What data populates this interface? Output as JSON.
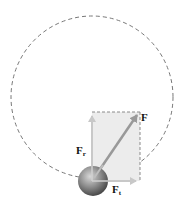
{
  "diagram": {
    "title": "",
    "path": {
      "type": "circle",
      "style": "dashed",
      "color": "#777777"
    },
    "object": {
      "type": "sphere",
      "color": "#8a8a8a"
    },
    "components_box": {
      "fill": "#ececec",
      "border": "#8a8a8a",
      "style": "dashed"
    },
    "vectors": [
      {
        "id": "F",
        "label": "F",
        "subscript": "",
        "direction": "resultant",
        "color": "#9a9a9a"
      },
      {
        "id": "Fr",
        "label": "F",
        "subscript": "r",
        "direction": "radial (up)",
        "color": "#c8c8c8"
      },
      {
        "id": "Ft",
        "label": "F",
        "subscript": "t",
        "direction": "tangential (right)",
        "color": "#c8c8c8"
      }
    ]
  }
}
